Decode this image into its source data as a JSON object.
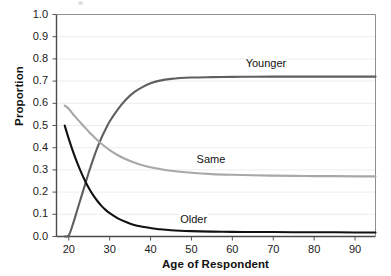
{
  "chart_data": {
    "type": "line",
    "title": "",
    "xlabel": "Age of Respondent",
    "ylabel": "Proportion",
    "xlim": [
      17,
      95
    ],
    "ylim": [
      0.0,
      1.0
    ],
    "grid": true,
    "grid_orientation": "horizontal",
    "legend_position": "inline-annotations",
    "xticks": [
      20,
      30,
      40,
      50,
      60,
      70,
      80,
      90
    ],
    "xtick_labels": [
      "20",
      "30",
      "40",
      "50",
      "60",
      "70",
      "80",
      "90"
    ],
    "yticks": [
      0.0,
      0.1,
      0.2,
      0.3,
      0.4,
      0.5,
      0.6,
      0.7,
      0.8,
      0.9,
      1.0
    ],
    "ytick_labels": [
      "0.0",
      "0.1",
      "0.2",
      "0.3",
      "0.4",
      "0.5",
      "0.6",
      "0.7",
      "0.8",
      "0.9",
      "1.0"
    ],
    "x": [
      19,
      20,
      21,
      22,
      23,
      24,
      25,
      26,
      27,
      28,
      29,
      30,
      32,
      34,
      36,
      38,
      40,
      42,
      45,
      50,
      55,
      60,
      65,
      70,
      75,
      80,
      85,
      90,
      95
    ],
    "series": [
      {
        "name": "Younger",
        "color": "#5f5f5f",
        "label": "Younger",
        "label_x": 63,
        "label_y": 0.775,
        "values": [
          0.0,
          0.005,
          0.055,
          0.115,
          0.175,
          0.235,
          0.295,
          0.35,
          0.4,
          0.445,
          0.483,
          0.518,
          0.573,
          0.617,
          0.65,
          0.673,
          0.69,
          0.701,
          0.71,
          0.716,
          0.718,
          0.719,
          0.7195,
          0.72,
          0.72,
          0.72,
          0.72,
          0.72,
          0.72
        ]
      },
      {
        "name": "Same",
        "color": "#a8a8a8",
        "label": "Same",
        "label_x": 51,
        "label_y": 0.345,
        "values": [
          0.59,
          0.575,
          0.552,
          0.531,
          0.51,
          0.49,
          0.47,
          0.452,
          0.434,
          0.418,
          0.403,
          0.389,
          0.366,
          0.348,
          0.333,
          0.321,
          0.312,
          0.305,
          0.296,
          0.287,
          0.281,
          0.278,
          0.276,
          0.274,
          0.273,
          0.272,
          0.272,
          0.271,
          0.271
        ]
      },
      {
        "name": "Older",
        "color": "#111111",
        "label": "Older",
        "label_x": 47,
        "label_y": 0.073,
        "values": [
          0.5,
          0.44,
          0.385,
          0.335,
          0.29,
          0.25,
          0.215,
          0.185,
          0.16,
          0.138,
          0.12,
          0.105,
          0.082,
          0.065,
          0.052,
          0.044,
          0.038,
          0.033,
          0.028,
          0.024,
          0.022,
          0.021,
          0.02,
          0.02,
          0.019,
          0.019,
          0.019,
          0.018,
          0.018
        ]
      }
    ]
  },
  "axis": {
    "ylabel": "Proportion",
    "xlabel": "Age of Respondent"
  }
}
